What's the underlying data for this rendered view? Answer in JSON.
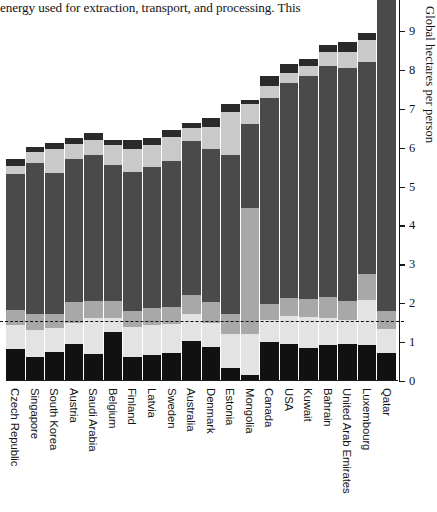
{
  "body_text": {
    "fragment": "energy used for extraction, transport, and processing. This"
  },
  "figure": {
    "y_axis_title": "Global hectares per person",
    "y_ticks": [
      {
        "value": 0,
        "label": "0"
      },
      {
        "value": 1,
        "label": "1"
      },
      {
        "value": 2,
        "label": "2"
      },
      {
        "value": 3,
        "label": "3"
      },
      {
        "value": 4,
        "label": "4"
      },
      {
        "value": 5,
        "label": "5"
      },
      {
        "value": 6,
        "label": "6"
      },
      {
        "value": 7,
        "label": "7"
      },
      {
        "value": 8,
        "label": "8"
      },
      {
        "value": 9,
        "label": "9"
      }
    ]
  },
  "colors": {
    "carbon": "#111111",
    "cropland": "#e3e3e3",
    "grazing": "#a8a8a8",
    "forest": "#4a4a4a",
    "fishing": "#c9c9c9",
    "built": "#2a2a2a",
    "axis": "#1a1a1a",
    "background": "#ffffff"
  },
  "chart_data": {
    "type": "bar",
    "subtype": "stacked-bar",
    "title": "",
    "xlabel": "",
    "ylabel": "Global hectares per person",
    "ylim": [
      0,
      9.6
    ],
    "ytick_interval": 1,
    "grid": false,
    "legend": "none",
    "annotations": [
      {
        "type": "dashed-horizontal-line",
        "label": "world biocapacity per person",
        "value": 1.53
      }
    ],
    "categories": [
      "Czech Republic",
      "Singapore",
      "South Korea",
      "Austria",
      "Saudi Arabia",
      "Belgium",
      "Finland",
      "Latvia",
      "Sweden",
      "Australia",
      "Denmark",
      "Estonia",
      "Mongolia",
      "Canada",
      "USA",
      "Kuwait",
      "Bahrain",
      "United Arab Emirates",
      "Luxembourg",
      "Qatar"
    ],
    "totals": [
      5.72,
      6.02,
      6.13,
      6.26,
      6.38,
      6.19,
      6.21,
      6.26,
      6.45,
      6.63,
      6.75,
      7.11,
      7.22,
      7.85,
      8.14,
      8.29,
      8.65,
      8.71,
      8.95,
      10.95
    ],
    "series": [
      {
        "name": "Carbon footprint",
        "color": "#111111",
        "values": [
          0.82,
          0.62,
          0.75,
          0.95,
          0.7,
          1.26,
          0.62,
          0.67,
          0.72,
          1.03,
          0.88,
          0.33,
          0.15,
          1.0,
          0.95,
          0.85,
          0.93,
          0.95,
          0.93,
          0.72
        ]
      },
      {
        "name": "Cropland",
        "color": "#e3e3e3",
        "values": [
          0.62,
          0.7,
          0.62,
          0.55,
          0.93,
          0.36,
          0.78,
          0.78,
          0.75,
          0.7,
          0.62,
          0.88,
          1.05,
          0.57,
          0.72,
          0.8,
          0.7,
          0.62,
          1.15,
          0.62
        ]
      },
      {
        "name": "Grazing land",
        "color": "#a8a8a8",
        "values": [
          0.38,
          0.41,
          0.36,
          0.52,
          0.44,
          0.44,
          0.39,
          0.44,
          0.44,
          0.49,
          0.52,
          0.52,
          3.26,
          0.41,
          0.46,
          0.46,
          0.52,
          0.49,
          0.67,
          0.46
        ]
      },
      {
        "name": "Forest products",
        "color": "#4a4a4a",
        "values": [
          3.49,
          3.87,
          3.62,
          3.69,
          3.74,
          3.49,
          3.59,
          3.62,
          3.74,
          3.95,
          3.95,
          4.08,
          2.16,
          5.3,
          5.54,
          5.74,
          5.95,
          6.0,
          5.44,
          8.75
        ]
      },
      {
        "name": "Fishing grounds",
        "color": "#c9c9c9",
        "values": [
          0.21,
          0.28,
          0.62,
          0.39,
          0.39,
          0.51,
          0.59,
          0.57,
          0.62,
          0.33,
          0.57,
          1.1,
          0.49,
          0.31,
          0.26,
          0.26,
          0.36,
          0.41,
          0.57,
          0.23
        ]
      },
      {
        "name": "Built-up land",
        "color": "#2a2a2a",
        "values": [
          0.2,
          0.14,
          0.16,
          0.16,
          0.18,
          0.13,
          0.24,
          0.18,
          0.18,
          0.13,
          0.21,
          0.2,
          0.11,
          0.26,
          0.21,
          0.18,
          0.19,
          0.24,
          0.19,
          0.17
        ]
      }
    ]
  }
}
